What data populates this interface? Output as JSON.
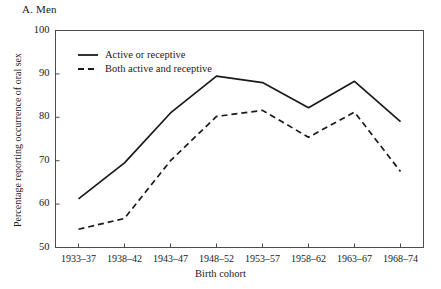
{
  "panel": {
    "title": "A. Men"
  },
  "axes": {
    "ylabel": "Percentage reporting occurrence of oral sex",
    "xlabel": "Birth cohort",
    "yticks": [
      "50",
      "60",
      "70",
      "80",
      "90",
      "100"
    ],
    "xticks": [
      "1933–37",
      "1938–42",
      "1943–47",
      "1948–52",
      "1953–57",
      "1958–62",
      "1963–67",
      "1968–74"
    ]
  },
  "legend": {
    "items": [
      {
        "label": "Active or receptive",
        "style": "solid"
      },
      {
        "label": "Both active and receptive",
        "style": "dashed"
      }
    ]
  },
  "colors": {
    "line": "#1a1a1a",
    "frame": "#4d4d4d",
    "background": "#ffffff"
  },
  "chart_data": {
    "type": "line",
    "title": "A. Men",
    "xlabel": "Birth cohort",
    "ylabel": "Percentage reporting occurrence of oral sex",
    "categories": [
      "1933–37",
      "1938–42",
      "1943–47",
      "1948–52",
      "1953–57",
      "1958–62",
      "1963–67",
      "1968–74"
    ],
    "ylim": [
      50,
      100
    ],
    "yticks": [
      50,
      60,
      70,
      80,
      90,
      100
    ],
    "grid": false,
    "legend_position": "upper-left-inside",
    "series": [
      {
        "name": "Active or receptive",
        "style": "solid",
        "values": [
          61.2,
          69.5,
          81.0,
          89.5,
          88.0,
          82.2,
          88.3,
          79.0
        ]
      },
      {
        "name": "Both active and receptive",
        "style": "dashed",
        "values": [
          54.2,
          56.7,
          70.0,
          80.2,
          81.6,
          75.4,
          81.2,
          67.5
        ]
      }
    ]
  }
}
